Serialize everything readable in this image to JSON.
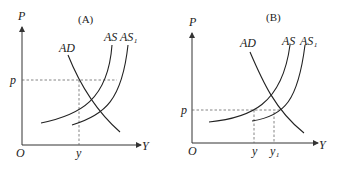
{
  "panels": [
    {
      "title": "(A)",
      "y_axis_label": "P",
      "x_axis_label": "Y",
      "origin_label": "O",
      "price_label": "p",
      "output_labels": [
        "y"
      ],
      "curves": [
        "AD",
        "AS",
        "AS₁"
      ]
    },
    {
      "title": "(B)",
      "y_axis_label": "P",
      "x_axis_label": "Y",
      "origin_label": "O",
      "price_label": "p",
      "output_labels": [
        "y",
        "y₁"
      ],
      "curves": [
        "AD",
        "AS",
        "AS₁"
      ]
    }
  ]
}
